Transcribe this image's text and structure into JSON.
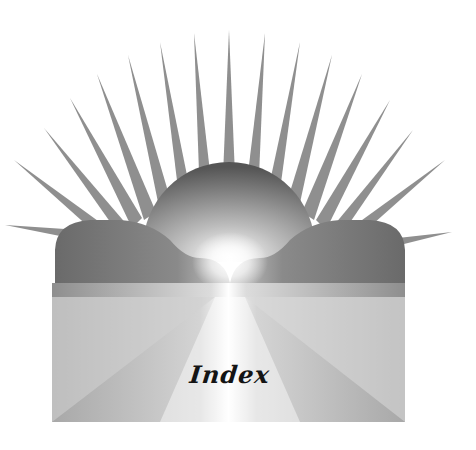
{
  "illustration": {
    "subject": "sunrise-over-clouds-emblem",
    "label": "Index",
    "colors": {
      "background": "#ffffff",
      "ray": "#8c8c8c",
      "sun_dark": "#5e5e5e",
      "sun_light": "#ffffff",
      "cloud_dark": "#707070",
      "cloud_light": "#bdbdbd",
      "panel_light": "#e6e6e6",
      "panel_dark": "#9a9a9a",
      "text": "#141414"
    },
    "rays": [
      {
        "tip": [
          229,
          30
        ]
      },
      {
        "tip": [
          194,
          33
        ]
      },
      {
        "tip": [
          265,
          33
        ]
      },
      {
        "tip": [
          160,
          42
        ]
      },
      {
        "tip": [
          300,
          42
        ]
      },
      {
        "tip": [
          128,
          55
        ]
      },
      {
        "tip": [
          332,
          55
        ]
      },
      {
        "tip": [
          97,
          74
        ]
      },
      {
        "tip": [
          362,
          74
        ]
      },
      {
        "tip": [
          70,
          98
        ]
      },
      {
        "tip": [
          390,
          100
        ]
      },
      {
        "tip": [
          44,
          128
        ]
      },
      {
        "tip": [
          413,
          130
        ]
      },
      {
        "tip": [
          14,
          160
        ]
      },
      {
        "tip": [
          445,
          160
        ]
      },
      {
        "tip": [
          5,
          225
        ]
      },
      {
        "tip": [
          452,
          232
        ]
      }
    ]
  }
}
